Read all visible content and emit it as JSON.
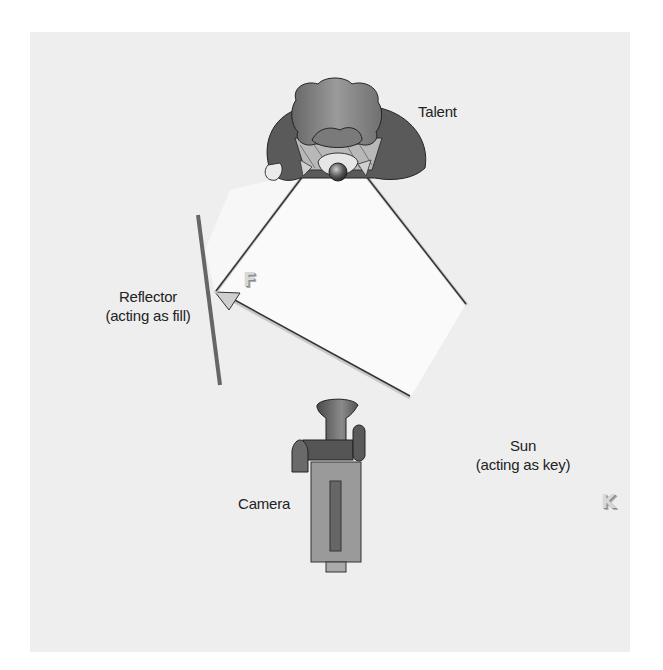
{
  "diagram": {
    "title": "",
    "labels": {
      "talent": "Talent",
      "reflector_line1": "Reflector",
      "reflector_line2": "(acting as fill)",
      "camera": "Camera",
      "sun_line1": "Sun",
      "sun_line2": "(acting as key)"
    },
    "markers": {
      "fill": "F",
      "key": "K"
    },
    "elements": [
      {
        "id": "talent",
        "type": "person-top-view",
        "label": "Talent"
      },
      {
        "id": "reflector",
        "type": "reflector-board",
        "label": "Reflector (acting as fill)"
      },
      {
        "id": "camera",
        "type": "camera-top-view",
        "label": "Camera"
      },
      {
        "id": "sun",
        "type": "light-source-offscreen",
        "label": "Sun (acting as key)"
      }
    ],
    "connections": [
      {
        "from": "sun",
        "to": "reflector",
        "kind": "light-ray"
      },
      {
        "from": "reflector",
        "to": "talent",
        "kind": "fill-light-ray",
        "marker": "F"
      },
      {
        "from": "sun",
        "to": "talent",
        "kind": "key-light-ray",
        "marker": "K"
      }
    ],
    "colors": {
      "panel": "#eeeeee",
      "beam": "#fafafa",
      "line": "#333333",
      "reflector": "#666666",
      "figure_dark": "#555555",
      "figure_mid": "#8a8a8a"
    }
  }
}
